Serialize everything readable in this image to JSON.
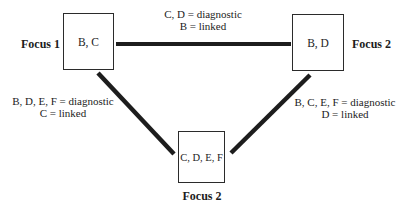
{
  "diagram": {
    "colors": {
      "background": "#ffffff",
      "line": "#1d1d1d",
      "text": "#1c1c1c",
      "box_border": "#2b2b2b"
    },
    "nodes": [
      {
        "id": "focus-1",
        "box_label": "B, C",
        "caption": "Focus 1",
        "caption_position": "left"
      },
      {
        "id": "focus-2-right",
        "box_label": "B, D",
        "caption": "Focus 2",
        "caption_position": "right"
      },
      {
        "id": "focus-2-bottom",
        "box_label": "C, D, E, F",
        "caption": "Focus 2",
        "caption_position": "bottom"
      }
    ],
    "edges": [
      {
        "between": [
          "focus-1",
          "focus-2-right"
        ],
        "label_line1": "C, D = diagnostic",
        "label_line2": "B = linked"
      },
      {
        "between": [
          "focus-1",
          "focus-2-bottom"
        ],
        "label_line1": "B, D, E, F = diagnostic",
        "label_line2": "C = linked"
      },
      {
        "between": [
          "focus-2-right",
          "focus-2-bottom"
        ],
        "label_line1": "B, C, E, F = diagnostic",
        "label_line2": "D = linked"
      }
    ]
  }
}
